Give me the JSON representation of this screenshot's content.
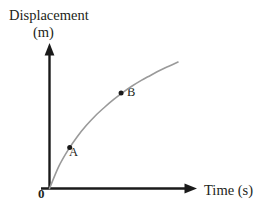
{
  "figure": {
    "background_color": "#ffffff",
    "width": 263,
    "height": 211
  },
  "axes": {
    "color": "#1a1a1a",
    "y_axis": {
      "title_line1": "Displacement",
      "title_line2": "(m)",
      "label": "Displacement (m)",
      "arrow": "up-arrow"
    },
    "x_axis": {
      "title": "Time (s)",
      "arrow": "right-arrow"
    },
    "origin_label": "0"
  },
  "chart_data": {
    "type": "line",
    "title": "",
    "subtitle": "",
    "xlabel": "Time (s)",
    "ylabel": "Displacement (m)",
    "grid": false,
    "legend": null,
    "curve": {
      "name": "displacement-time curve",
      "color": "#9a9a9a",
      "shape": "concave-down increasing (decelerating motion)",
      "description": "Displacement increases with time at a steadily decreasing rate, starting from the origin.",
      "x": [
        0,
        0.5,
        1,
        1.5,
        2,
        2.5,
        3,
        3.5,
        4,
        4.5,
        5,
        5.5,
        6,
        6.5,
        7
      ],
      "y": [
        0,
        1.55,
        2.7,
        3.65,
        4.45,
        5.15,
        5.75,
        6.3,
        6.8,
        7.25,
        7.65,
        8.0,
        8.35,
        8.65,
        8.95
      ]
    },
    "annotations": [
      {
        "label": "A",
        "x": 1.1,
        "y": 2.9,
        "marker": "dot",
        "color": "#1a1a1a"
      },
      {
        "label": "B",
        "x": 3.9,
        "y": 6.75,
        "marker": "dot",
        "color": "#1a1a1a"
      }
    ],
    "xlim": [
      0,
      8
    ],
    "ylim": [
      0,
      10
    ]
  }
}
